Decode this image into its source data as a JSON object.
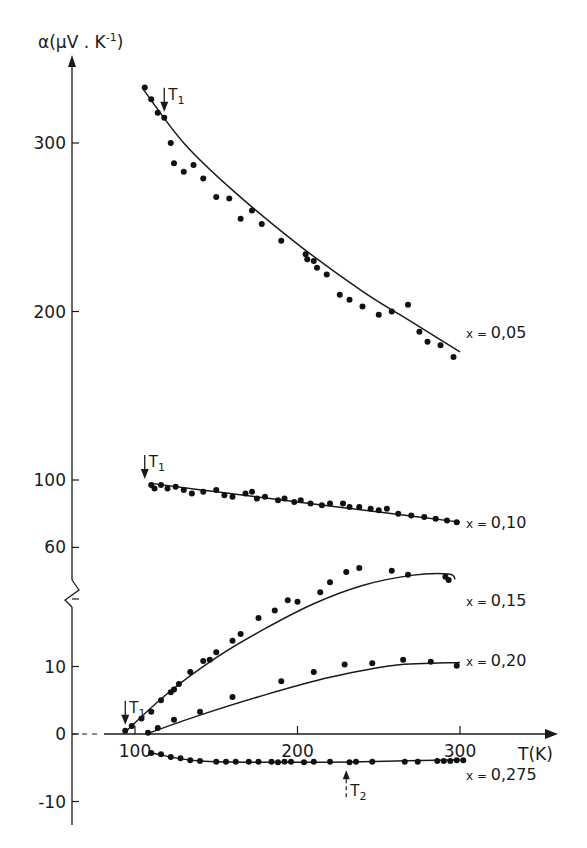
{
  "chart_data": {
    "type": "scatter",
    "title": "",
    "xlabel": "T(K)",
    "ylabel": "α(μV.K⁻¹)",
    "ylabel_main": "α(μV . K",
    "ylabel_sup": "-1",
    "ylabel_close": ")",
    "x_ticks": [
      100,
      200,
      300
    ],
    "x_tick_labels": [
      "100",
      "200",
      "300"
    ],
    "y_ticks_upper": [
      300,
      200,
      100,
      60
    ],
    "y_ticks_lower": [
      10,
      0,
      -10
    ],
    "y_tick_labels": [
      "300",
      "200",
      "100",
      "60",
      "10",
      "0",
      "-10"
    ],
    "axis_break": "y-axis broken between 60 and ~20",
    "xlim": [
      60,
      330
    ],
    "grid": false,
    "legend_position": "inline labels at right end of curves",
    "annotations": [
      {
        "text": "T",
        "sub": "1",
        "series": "x = 0,05",
        "T": 118,
        "direction": "down"
      },
      {
        "text": "T",
        "sub": "1",
        "series": "x = 0,10",
        "T": 106,
        "direction": "down"
      },
      {
        "text": "T",
        "sub": "1",
        "series": "x = 0,15",
        "T": 94,
        "direction": "down"
      },
      {
        "text": "T",
        "sub": "2",
        "series": "x = 0,275",
        "T": 230,
        "direction": "up"
      }
    ],
    "series": [
      {
        "name": "x = 0,05",
        "label": "x = 0,05",
        "fit": [
          [
            105,
            332
          ],
          [
            130,
            300
          ],
          [
            160,
            272
          ],
          [
            200,
            240
          ],
          [
            240,
            212
          ],
          [
            270,
            194
          ],
          [
            300,
            176
          ]
        ],
        "points": [
          [
            106,
            333
          ],
          [
            110,
            326
          ],
          [
            114,
            318
          ],
          [
            118,
            315
          ],
          [
            122,
            300
          ],
          [
            124,
            288
          ],
          [
            130,
            283
          ],
          [
            136,
            287
          ],
          [
            142,
            279
          ],
          [
            150,
            268
          ],
          [
            158,
            267
          ],
          [
            165,
            255
          ],
          [
            172,
            260
          ],
          [
            178,
            252
          ],
          [
            190,
            242
          ],
          [
            205,
            234
          ],
          [
            206,
            231
          ],
          [
            210,
            230
          ],
          [
            212,
            226
          ],
          [
            218,
            222
          ],
          [
            226,
            210
          ],
          [
            232,
            207
          ],
          [
            240,
            203
          ],
          [
            250,
            198
          ],
          [
            258,
            200
          ],
          [
            268,
            204
          ],
          [
            275,
            188
          ],
          [
            280,
            182
          ],
          [
            288,
            180
          ],
          [
            296,
            173
          ]
        ]
      },
      {
        "name": "x = 0,10",
        "label": "x = 0,10",
        "fit": [
          [
            110,
            98
          ],
          [
            150,
            93
          ],
          [
            200,
            87
          ],
          [
            250,
            81
          ],
          [
            300,
            75
          ]
        ],
        "points": [
          [
            110,
            97
          ],
          [
            112,
            95
          ],
          [
            116,
            97
          ],
          [
            120,
            95
          ],
          [
            125,
            96
          ],
          [
            130,
            94
          ],
          [
            135,
            92
          ],
          [
            142,
            93
          ],
          [
            150,
            94
          ],
          [
            155,
            91
          ],
          [
            160,
            90
          ],
          [
            168,
            92
          ],
          [
            172,
            93
          ],
          [
            175,
            89
          ],
          [
            180,
            90
          ],
          [
            188,
            88
          ],
          [
            192,
            89
          ],
          [
            198,
            87
          ],
          [
            202,
            88
          ],
          [
            208,
            86
          ],
          [
            215,
            85
          ],
          [
            220,
            86
          ],
          [
            228,
            86
          ],
          [
            232,
            84
          ],
          [
            238,
            84
          ],
          [
            245,
            83
          ],
          [
            250,
            82
          ],
          [
            255,
            83
          ],
          [
            262,
            80
          ],
          [
            270,
            79
          ],
          [
            278,
            78
          ],
          [
            285,
            77
          ],
          [
            292,
            76
          ],
          [
            298,
            75
          ]
        ]
      },
      {
        "name": "x = 0,15",
        "label": "x = 0,15",
        "fit": [
          [
            94,
            0.3
          ],
          [
            120,
            6
          ],
          [
            150,
            11.3
          ],
          [
            180,
            15.6
          ],
          [
            210,
            19.3
          ],
          [
            240,
            22
          ],
          [
            270,
            23.5
          ],
          [
            293,
            23.7
          ],
          [
            297,
            22.9
          ]
        ],
        "points": [
          [
            94,
            0.5
          ],
          [
            98,
            1.2
          ],
          [
            104,
            2.3
          ],
          [
            110,
            3.3
          ],
          [
            116,
            5.0
          ],
          [
            122,
            6.2
          ],
          [
            124,
            6.6
          ],
          [
            127,
            7.4
          ],
          [
            134,
            9.2
          ],
          [
            142,
            10.8
          ],
          [
            146,
            11.0
          ],
          [
            150,
            12.1
          ],
          [
            160,
            13.8
          ],
          [
            165,
            14.8
          ],
          [
            176,
            17.2
          ],
          [
            186,
            18.3
          ],
          [
            194,
            19.8
          ],
          [
            200,
            19.6
          ],
          [
            214,
            21.0
          ],
          [
            220,
            22.5
          ],
          [
            230,
            24.0
          ],
          [
            238,
            24.6
          ],
          [
            258,
            24.2
          ],
          [
            268,
            23.6
          ],
          [
            291,
            23.3
          ],
          [
            293,
            22.8
          ]
        ]
      },
      {
        "name": "x = 0,20",
        "label": "x = 0,20",
        "fit": [
          [
            108,
            0.1
          ],
          [
            140,
            2.8
          ],
          [
            180,
            5.8
          ],
          [
            220,
            8.4
          ],
          [
            260,
            10.2
          ],
          [
            300,
            10.6
          ]
        ],
        "points": [
          [
            108,
            0.2
          ],
          [
            114,
            0.9
          ],
          [
            124,
            2.1
          ],
          [
            140,
            3.3
          ],
          [
            160,
            5.5
          ],
          [
            190,
            7.8
          ],
          [
            210,
            9.2
          ],
          [
            229,
            10.3
          ],
          [
            246,
            10.5
          ],
          [
            265,
            11.0
          ],
          [
            282,
            10.7
          ],
          [
            298,
            10.1
          ]
        ]
      },
      {
        "name": "x = 0,275",
        "label": "x = 0,275",
        "fit": [
          [
            110,
            -2.8
          ],
          [
            140,
            -4.0
          ],
          [
            200,
            -4.2
          ],
          [
            260,
            -4.0
          ],
          [
            300,
            -3.8
          ]
        ],
        "points": [
          [
            110,
            -2.8
          ],
          [
            116,
            -3.0
          ],
          [
            122,
            -3.4
          ],
          [
            128,
            -3.6
          ],
          [
            134,
            -3.9
          ],
          [
            140,
            -4.0
          ],
          [
            150,
            -4.1
          ],
          [
            156,
            -4.1
          ],
          [
            162,
            -4.1
          ],
          [
            170,
            -4.1
          ],
          [
            176,
            -4.1
          ],
          [
            184,
            -4.1
          ],
          [
            188,
            -4.2
          ],
          [
            192,
            -4.1
          ],
          [
            196,
            -4.1
          ],
          [
            204,
            -4.2
          ],
          [
            210,
            -4.1
          ],
          [
            220,
            -4.1
          ],
          [
            232,
            -4.2
          ],
          [
            236,
            -4.1
          ],
          [
            246,
            -4.1
          ],
          [
            266,
            -4.1
          ],
          [
            274,
            -4.1
          ],
          [
            286,
            -4.0
          ],
          [
            290,
            -4.0
          ],
          [
            294,
            -4.0
          ],
          [
            298,
            -3.9
          ],
          [
            302,
            -3.9
          ]
        ]
      }
    ]
  }
}
